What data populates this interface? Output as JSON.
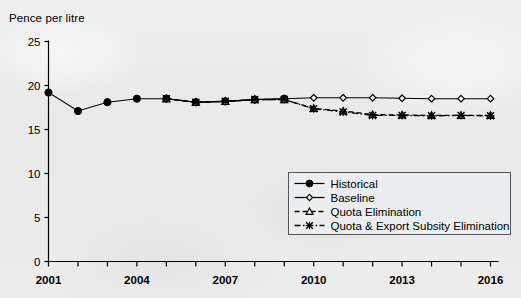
{
  "chart_data": {
    "type": "line",
    "title": "Pence per litre",
    "xlabel": "",
    "ylabel": "Pence per litre",
    "xlim": [
      2001,
      2016
    ],
    "ylim": [
      0,
      25
    ],
    "yticks": [
      0,
      5,
      10,
      15,
      20,
      25
    ],
    "xticks": [
      2001,
      2002,
      2003,
      2004,
      2005,
      2006,
      2007,
      2008,
      2009,
      2010,
      2011,
      2012,
      2013,
      2014,
      2015,
      2016
    ],
    "xtick_labels_shown": [
      "2001",
      "2004",
      "2007",
      "2010",
      "2013",
      "2016"
    ],
    "grid": false,
    "legend_position": "inside-lower-right",
    "series": [
      {
        "name": "Historical",
        "marker": "filled-circle",
        "line_style": "solid",
        "x": [
          2001,
          2002,
          2003,
          2004,
          2005,
          2006,
          2007,
          2008,
          2009
        ],
        "values": [
          19.2,
          17.1,
          18.1,
          18.5,
          18.5,
          18.1,
          18.2,
          18.4,
          18.5
        ]
      },
      {
        "name": "Baseline",
        "marker": "open-diamond",
        "line_style": "solid",
        "x": [
          2005,
          2006,
          2007,
          2008,
          2009,
          2010,
          2011,
          2012,
          2013,
          2014,
          2015,
          2016
        ],
        "values": [
          18.5,
          18.1,
          18.2,
          18.4,
          18.5,
          18.6,
          18.6,
          18.6,
          18.55,
          18.5,
          18.5,
          18.5
        ]
      },
      {
        "name": "Quota Elimination",
        "marker": "open-triangle",
        "line_style": "dashed",
        "x": [
          2005,
          2006,
          2007,
          2008,
          2009,
          2010,
          2011,
          2012,
          2013,
          2014,
          2015,
          2016
        ],
        "values": [
          18.5,
          18.1,
          18.2,
          18.4,
          18.4,
          17.4,
          17.1,
          16.7,
          16.65,
          16.6,
          16.6,
          16.6
        ]
      },
      {
        "name": "Quota & Export Subsity Elimination",
        "marker": "x-cross",
        "line_style": "dash-dot",
        "x": [
          2005,
          2006,
          2007,
          2008,
          2009,
          2010,
          2011,
          2012,
          2013,
          2014,
          2015,
          2016
        ],
        "values": [
          18.5,
          18.1,
          18.2,
          18.4,
          18.4,
          17.35,
          17.0,
          16.6,
          16.6,
          16.55,
          16.6,
          16.55
        ]
      }
    ]
  },
  "axis": {
    "y_tick_labels": [
      "25",
      "20",
      "15",
      "10",
      "5",
      "0"
    ],
    "x_tick_labels": [
      "2001",
      "2004",
      "2007",
      "2010",
      "2013",
      "2016"
    ]
  },
  "legend": {
    "items": [
      {
        "label": "Historical",
        "marker": "filled-circle",
        "style": "solid"
      },
      {
        "label": "Baseline",
        "marker": "open-diamond",
        "style": "solid"
      },
      {
        "label": "Quota Elimination",
        "marker": "open-triangle",
        "style": "dashed"
      },
      {
        "label": "Quota & Export Subsity Elimination",
        "marker": "x-cross",
        "style": "dash-dot"
      }
    ]
  },
  "colors": {
    "ink": "#000000",
    "paper": "#ecedee"
  }
}
